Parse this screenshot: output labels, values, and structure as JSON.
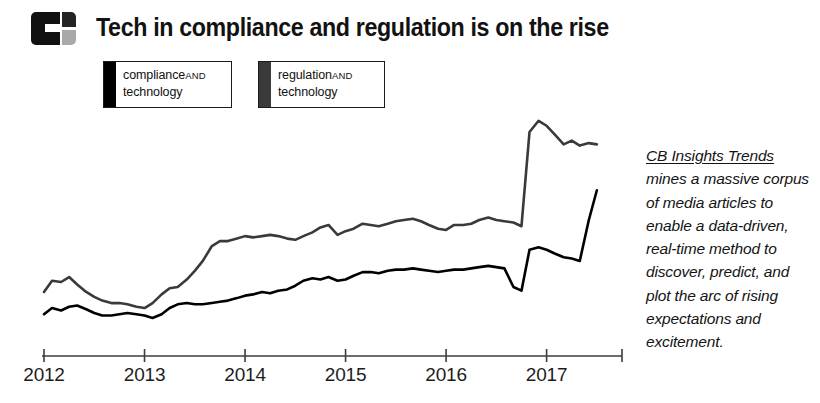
{
  "header": {
    "logo_name": "cb-insights-logo",
    "title": "Tech in compliance and regulation is on the rise"
  },
  "legend": {
    "items": [
      {
        "label_line1": "compliance",
        "conjunction": "AND",
        "label_line2": "technology",
        "color": "#000000"
      },
      {
        "label_line1": "regulation",
        "conjunction": "AND",
        "label_line2": "technology",
        "color": "#3a3a3a"
      }
    ]
  },
  "blurb": {
    "brand": "CB Insights Trends",
    "rest": " mines a massive corpus of media articles to enable a data-driven, real-time method to discover, predict, and plot the arc of rising expectations and excitement."
  },
  "chart_data": {
    "type": "line",
    "title": "Tech in compliance and regulation is on the rise",
    "xlabel": "",
    "ylabel": "",
    "grid": false,
    "legend_position": "top-left",
    "xlim": [
      2012.0,
      2017.75
    ],
    "ylim": [
      0,
      100
    ],
    "xticks": [
      2012,
      2013,
      2014,
      2015,
      2016,
      2017
    ],
    "xtick_labels": [
      "2012",
      "2013",
      "2014",
      "2015",
      "2016",
      "2017"
    ],
    "x": [
      2012.0,
      2012.08,
      2012.17,
      2012.25,
      2012.33,
      2012.42,
      2012.5,
      2012.58,
      2012.67,
      2012.75,
      2012.83,
      2012.92,
      2013.0,
      2013.08,
      2013.17,
      2013.25,
      2013.33,
      2013.42,
      2013.5,
      2013.58,
      2013.67,
      2013.75,
      2013.83,
      2013.92,
      2014.0,
      2014.08,
      2014.17,
      2014.25,
      2014.33,
      2014.42,
      2014.5,
      2014.58,
      2014.67,
      2014.75,
      2014.83,
      2014.92,
      2015.0,
      2015.08,
      2015.17,
      2015.25,
      2015.33,
      2015.42,
      2015.5,
      2015.58,
      2015.67,
      2015.75,
      2015.83,
      2015.92,
      2016.0,
      2016.08,
      2016.17,
      2016.25,
      2016.33,
      2016.42,
      2016.5,
      2016.58,
      2016.67,
      2016.75,
      2016.83,
      2016.92,
      2017.0,
      2017.08,
      2017.17,
      2017.25,
      2017.33,
      2017.42,
      2017.5
    ],
    "series": [
      {
        "name": "regulation AND technology",
        "color": "#3a3a3a",
        "values": [
          21.0,
          25.5,
          25.0,
          27.0,
          24.0,
          21.0,
          19.0,
          17.5,
          16.5,
          16.5,
          16.0,
          15.0,
          14.5,
          16.5,
          20.0,
          22.5,
          23.0,
          26.0,
          29.5,
          33.5,
          39.5,
          41.5,
          41.5,
          42.5,
          43.5,
          43.0,
          43.5,
          44.0,
          43.5,
          42.5,
          42.0,
          43.5,
          45.0,
          47.0,
          48.0,
          44.0,
          45.5,
          46.5,
          48.5,
          48.0,
          47.5,
          48.5,
          49.5,
          50.0,
          50.5,
          49.5,
          48.0,
          46.5,
          46.0,
          48.0,
          48.0,
          48.5,
          50.0,
          51.0,
          50.0,
          49.5,
          49.0,
          47.5,
          85.5,
          90.0,
          88.0,
          84.5,
          80.5,
          82.0,
          80.0,
          81.0,
          80.5
        ]
      },
      {
        "name": "compliance AND technology",
        "color": "#000000",
        "values": [
          12.0,
          14.5,
          13.5,
          15.0,
          15.5,
          14.0,
          12.5,
          11.5,
          11.5,
          12.0,
          12.5,
          12.0,
          11.5,
          10.5,
          12.0,
          14.5,
          16.0,
          16.5,
          16.0,
          16.0,
          16.5,
          17.0,
          17.5,
          18.5,
          19.5,
          20.0,
          21.0,
          20.5,
          21.5,
          22.0,
          23.5,
          25.5,
          26.5,
          26.0,
          27.0,
          25.5,
          26.0,
          27.5,
          29.0,
          29.0,
          28.5,
          29.5,
          30.0,
          30.0,
          30.5,
          30.0,
          29.5,
          29.0,
          29.5,
          30.0,
          30.0,
          30.5,
          31.0,
          31.5,
          31.0,
          30.5,
          23.0,
          21.5,
          38.0,
          39.0,
          38.0,
          36.5,
          35.0,
          34.5,
          33.5,
          50.0,
          62.0
        ]
      }
    ]
  }
}
